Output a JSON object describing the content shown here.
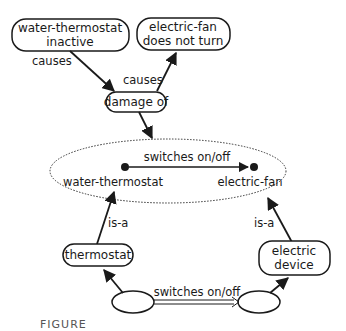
{
  "diagram": {
    "nodes": {
      "water_thermostat_inactive": {
        "line1": "water-thermostat",
        "line2": "inactive"
      },
      "electric_fan_not_turn": {
        "line1": "electric-fan",
        "line2": "does not turn"
      },
      "damage_of": {
        "label": "damage of"
      },
      "water_thermostat": {
        "label": "water-thermostat"
      },
      "electric_fan": {
        "label": "electric-fan"
      },
      "thermostat": {
        "label": "thermostat"
      },
      "electric_device": {
        "line1": "electric",
        "line2": "device"
      }
    },
    "edges": {
      "causes_left": "causes",
      "causes_right": "causes",
      "switches_top": "switches on/off",
      "isa_left": "is-a",
      "isa_right": "is-a",
      "switches_bottom": "switches on/off"
    },
    "colors": {
      "stroke": "#1a1a1a",
      "background": "#ffffff"
    }
  },
  "caption": "FIGURE"
}
